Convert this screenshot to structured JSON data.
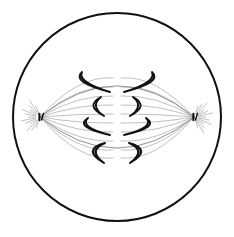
{
  "figure": {
    "background_color": "#ffffff",
    "width": 234,
    "height": 237
  },
  "cell": {
    "label": "cell membrane",
    "shape": "circle",
    "center_x": 117,
    "center_y": 117,
    "radius": 104,
    "stroke_color": "#111111",
    "stroke_width": 2.0,
    "fill_color": "#ffffff"
  },
  "poles": [
    {
      "name": "left-spindle-pole",
      "label": "centrosome (left pole)",
      "x": 40,
      "y": 117,
      "centriole_color": "#111111",
      "aster_color": "#b9b9b9",
      "aster_ray_count": 13,
      "aster_radius": 19
    },
    {
      "name": "right-spindle-pole",
      "label": "centrosome (right pole)",
      "x": 194,
      "y": 117,
      "centriole_color": "#111111",
      "aster_color": "#b9b9b9",
      "aster_ray_count": 13,
      "aster_radius": 19
    }
  ],
  "spindle": {
    "label": "mitotic spindle",
    "fiber_color": "#b0b0b0",
    "fiber_width": 0.8,
    "outer_fiber_color": "#8f8f8f",
    "outer_fiber_width": 1.0,
    "left_pole_x": 40,
    "right_pole_x": 194,
    "pole_y": 117,
    "fiber_end_y": [
      78,
      87,
      96,
      105,
      114,
      123,
      132,
      141,
      150,
      158
    ],
    "equator_x": 117
  },
  "chromosomes": {
    "label": "sister chromatids migrating to poles",
    "outline_color": "#111111",
    "dark_fill_color": "#5c5c5c",
    "light_fill_color": "#ffffff",
    "count": 8,
    "rows": [
      {
        "row": 1,
        "style": "dark",
        "left": {
          "name": "chromosome-row1-left",
          "tip_top_x": 82,
          "tip_top_y": 72,
          "bend_x": 74,
          "bend_y": 82,
          "tip_bot_x": 110,
          "tip_bot_y": 92,
          "thickness": 6.5
        },
        "right": {
          "name": "chromosome-row1-right",
          "tip_top_x": 152,
          "tip_top_y": 72,
          "bend_x": 160,
          "bend_y": 82,
          "tip_bot_x": 124,
          "tip_bot_y": 92,
          "thickness": 6.5
        }
      },
      {
        "row": 2,
        "style": "light",
        "left": {
          "name": "chromosome-row2-left",
          "tip_top_x": 101,
          "tip_top_y": 97,
          "bend_x": 87,
          "bend_y": 106,
          "tip_bot_x": 104,
          "tip_bot_y": 116,
          "thickness": 5.0
        },
        "right": {
          "name": "chromosome-row2-right",
          "tip_top_x": 133,
          "tip_top_y": 97,
          "bend_x": 147,
          "bend_y": 106,
          "tip_bot_x": 130,
          "tip_bot_y": 116,
          "thickness": 5.0
        }
      },
      {
        "row": 3,
        "style": "light",
        "left": {
          "name": "chromosome-row3-left",
          "tip_top_x": 88,
          "tip_top_y": 118,
          "bend_x": 76,
          "bend_y": 127,
          "tip_bot_x": 110,
          "tip_bot_y": 135,
          "thickness": 5.0
        },
        "right": {
          "name": "chromosome-row3-right",
          "tip_top_x": 146,
          "tip_top_y": 118,
          "bend_x": 158,
          "bend_y": 127,
          "tip_bot_x": 124,
          "tip_bot_y": 135,
          "thickness": 5.0
        }
      },
      {
        "row": 4,
        "style": "dark",
        "left": {
          "name": "chromosome-row4-left",
          "tip_top_x": 105,
          "tip_top_y": 143,
          "bend_x": 84,
          "bend_y": 150,
          "tip_bot_x": 104,
          "tip_bot_y": 163,
          "thickness": 6.5
        },
        "right": {
          "name": "chromosome-row4-right",
          "tip_top_x": 129,
          "tip_top_y": 143,
          "bend_x": 150,
          "bend_y": 150,
          "tip_bot_x": 130,
          "tip_bot_y": 163,
          "thickness": 6.5
        }
      }
    ]
  }
}
